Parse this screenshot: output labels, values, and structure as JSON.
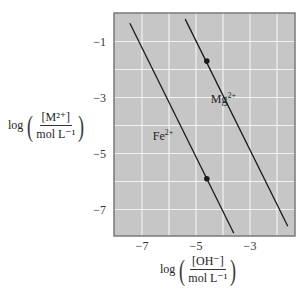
{
  "chart_data": {
    "type": "line",
    "title": "",
    "xlabel": {
      "prefix": "log",
      "numerator": "[OH⁻]",
      "denominator": "mol L⁻¹"
    },
    "ylabel": {
      "prefix": "log",
      "numerator": "[M²⁺]",
      "denominator": "mol L⁻¹"
    },
    "xlim": [
      -8.0,
      -1.3
    ],
    "ylim": [
      -8.0,
      0.0
    ],
    "xticks": [
      -7,
      -5,
      -3
    ],
    "yticks": [
      -1,
      -3,
      -5,
      -7
    ],
    "x_gridlines": [
      -7,
      -6,
      -5,
      -4,
      -3,
      -2
    ],
    "y_gridlines": [
      -1,
      -2,
      -3,
      -4,
      -5,
      -6,
      -7
    ],
    "grid": true,
    "legend": "none (inline series labels)",
    "series": [
      {
        "name": "Fe²⁺",
        "label_text": "Fe",
        "label_sup": "2+",
        "label_pos": [
          -6.6,
          -4.5
        ],
        "x": [
          -7.45,
          -3.6
        ],
        "y": [
          -0.35,
          -7.85
        ],
        "markers": [
          {
            "x": -4.6,
            "y": -5.9
          }
        ]
      },
      {
        "name": "Mg²⁺",
        "label_text": "Mg",
        "label_sup": "2+",
        "label_pos": [
          -4.45,
          -3.2
        ],
        "x": [
          -5.4,
          -1.6
        ],
        "y": [
          -0.2,
          -7.6
        ],
        "markers": [
          {
            "x": -4.6,
            "y": -1.7
          }
        ]
      }
    ],
    "colors": {
      "plot_background": "#c6c6c6",
      "gridline": "#f2f2f2",
      "frame": "#7a7a7a",
      "line": "#1a1a1a"
    }
  }
}
